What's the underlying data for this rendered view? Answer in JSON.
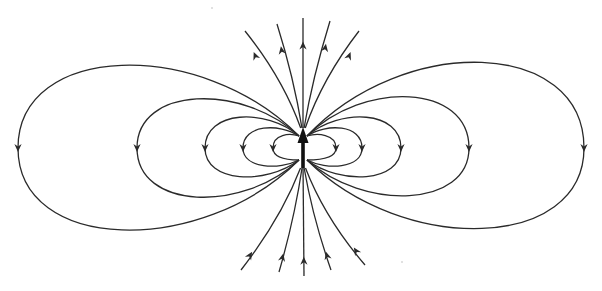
{
  "figure": {
    "type": "magnetic-dipole-field-lines",
    "colors": {
      "lines": "#2a2a2a",
      "dipole": "#111111",
      "background": "#ffffff"
    },
    "dipole": {
      "cx": 303,
      "cy": 148,
      "direction": "up"
    },
    "loops": [
      {
        "side": "left",
        "extent_x": 18,
        "top": 37,
        "bottom": 258,
        "arrow_y": 148
      },
      {
        "side": "left",
        "extent_x": 137,
        "top": 83,
        "bottom": 213,
        "arrow_y": 148
      },
      {
        "side": "left",
        "extent_x": 205,
        "top": 108,
        "bottom": 185,
        "arrow_y": 148
      },
      {
        "side": "left",
        "extent_x": 243,
        "top": 123,
        "bottom": 170,
        "arrow_y": 148
      },
      {
        "side": "left",
        "extent_x": 273,
        "top": 133,
        "bottom": 160,
        "arrow_y": 148
      },
      {
        "side": "right",
        "extent_x": 584,
        "top": 33,
        "bottom": 256,
        "arrow_y": 148
      },
      {
        "side": "right",
        "extent_x": 469,
        "top": 80,
        "bottom": 211,
        "arrow_y": 148
      },
      {
        "side": "right",
        "extent_x": 401,
        "top": 108,
        "bottom": 185,
        "arrow_y": 148
      },
      {
        "side": "right",
        "extent_x": 362,
        "top": 123,
        "bottom": 170,
        "arrow_y": 148
      },
      {
        "side": "right",
        "extent_x": 336,
        "top": 133,
        "bottom": 160,
        "arrow_y": 148
      }
    ],
    "open_lines_top": [
      {
        "x2": 245,
        "y2": 31
      },
      {
        "x2": 277,
        "y2": 24
      },
      {
        "x2": 303,
        "y2": 18
      },
      {
        "x2": 330,
        "y2": 21
      },
      {
        "x2": 359,
        "y2": 31
      }
    ],
    "open_lines_bottom": [
      {
        "x2": 241,
        "y2": 270
      },
      {
        "x2": 279,
        "y2": 272
      },
      {
        "x2": 304,
        "y2": 276
      },
      {
        "x2": 331,
        "y2": 270
      },
      {
        "x2": 365,
        "y2": 265
      }
    ]
  }
}
